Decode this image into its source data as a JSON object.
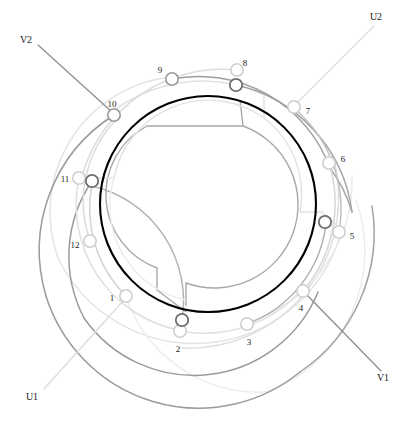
{
  "diagram": {
    "type": "circular-winding-schematic",
    "canvas": {
      "width": 395,
      "height": 427
    },
    "center": {
      "x": 208,
      "y": 204
    },
    "colors": {
      "bore": "#000000",
      "phase_u_dark": "#8a8a8a",
      "phase_u_light": "#d8d8d8",
      "phase_v_dark": "#9e9e9e",
      "phase_v_light": "#e2e2e2",
      "inner_mid": "#a0a0a0",
      "inner_light": "#e6e6e6",
      "label": "#1a1a1a"
    },
    "bore_circle": {
      "cx": 208,
      "cy": 204,
      "r": 108,
      "stroke_width": 2.1
    },
    "slot_nodes": [
      {
        "id": "1",
        "label": "1",
        "x": 126,
        "y": 296,
        "label_x": 112,
        "label_y": 299,
        "shade": "light"
      },
      {
        "id": "2",
        "label": "2",
        "x": 180,
        "y": 331,
        "label_x": 178,
        "label_y": 350,
        "shade": "light"
      },
      {
        "id": "3",
        "label": "3",
        "x": 247,
        "y": 324,
        "label_x": 249,
        "label_y": 343,
        "shade": "light"
      },
      {
        "id": "4",
        "label": "4",
        "x": 303,
        "y": 291,
        "label_x": 301,
        "label_y": 309,
        "shade": "light"
      },
      {
        "id": "5",
        "label": "5",
        "x": 339,
        "y": 232,
        "label_x": 352,
        "label_y": 237,
        "shade": "light"
      },
      {
        "id": "6",
        "label": "6",
        "x": 329,
        "y": 163,
        "label_x": 343,
        "label_y": 160,
        "shade": "light"
      },
      {
        "id": "7",
        "label": "7",
        "x": 294,
        "y": 107,
        "label_x": 308,
        "label_y": 112,
        "shade": "light"
      },
      {
        "id": "8",
        "label": "8",
        "x": 237,
        "y": 70,
        "label_x": 245,
        "label_y": 64,
        "shade": "light"
      },
      {
        "id": "9",
        "label": "9",
        "x": 172,
        "y": 79,
        "label_x": 160,
        "label_y": 71,
        "shade": "mid"
      },
      {
        "id": "10",
        "label": "10",
        "x": 114,
        "y": 115,
        "label_x": 112,
        "label_y": 105,
        "shade": "mid"
      },
      {
        "id": "11",
        "label": "11",
        "x": 79,
        "y": 178,
        "label_x": 65,
        "label_y": 180,
        "shade": "light"
      },
      {
        "id": "12",
        "label": "12",
        "x": 90,
        "y": 241,
        "label_x": 75,
        "label_y": 246,
        "shade": "light"
      }
    ],
    "coil_nodes": [
      {
        "id": "cn-a",
        "x": 236,
        "y": 85,
        "shade": "dark"
      },
      {
        "id": "cn-b",
        "x": 92,
        "y": 181,
        "shade": "dark"
      },
      {
        "id": "cn-c",
        "x": 182,
        "y": 320,
        "shade": "dark"
      },
      {
        "id": "cn-d",
        "x": 325,
        "y": 222,
        "shade": "dark"
      }
    ],
    "terminals": [
      {
        "id": "U1",
        "label": "U1",
        "label_x": 32,
        "label_y": 398,
        "lead_x1": 44,
        "lead_y1": 389,
        "lead_x2": 124,
        "lead_y2": 300
      },
      {
        "id": "U2",
        "label": "U2",
        "label_x": 376,
        "label_y": 18,
        "lead_x1": 374,
        "lead_y1": 26,
        "lead_x2": 297,
        "lead_y2": 103
      },
      {
        "id": "V1",
        "label": "V1",
        "label_x": 383,
        "label_y": 379,
        "lead_x1": 381,
        "lead_y1": 371,
        "lead_x2": 306,
        "lead_y2": 294
      },
      {
        "id": "V2",
        "label": "V2",
        "label_x": 26,
        "label_y": 41,
        "lead_x1": 38,
        "lead_y1": 45,
        "lead_x2": 112,
        "lead_y2": 112
      }
    ],
    "inner_arcs": [
      {
        "id": "inner-mid-ring",
        "r": 62,
        "shade": "mid",
        "start_deg": -65,
        "sweep_deg": 300
      },
      {
        "id": "inner-light-ring",
        "r": 82,
        "shade": "light",
        "start_deg": -75,
        "sweep_deg": 300
      }
    ],
    "outer_arcs": [
      {
        "id": "outer-u-dark-1",
        "r": 150,
        "shade": "u_dark"
      },
      {
        "id": "outer-u-dark-2",
        "r": 170,
        "shade": "u_dark"
      },
      {
        "id": "outer-v-light-1",
        "r": 150,
        "shade": "v_light"
      },
      {
        "id": "outer-v-light-2",
        "r": 170,
        "shade": "v_light"
      }
    ]
  }
}
